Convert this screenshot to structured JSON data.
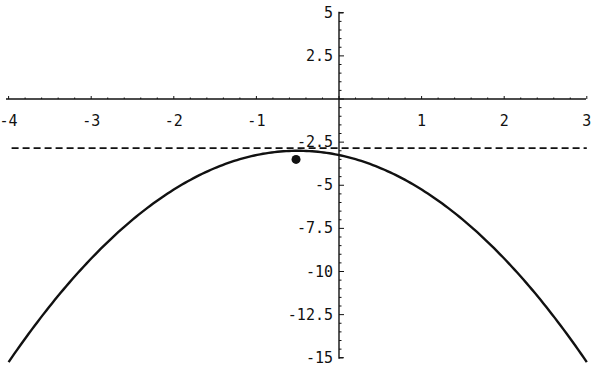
{
  "chart_data": {
    "type": "line",
    "title": "",
    "xlabel": "",
    "ylabel": "",
    "xlim": [
      -4,
      3
    ],
    "ylim": [
      -15,
      5
    ],
    "grid": false,
    "x_ticks": [
      -4,
      -3,
      -2,
      -1,
      1,
      2,
      3
    ],
    "x_tick_labels": [
      "-4",
      "-3",
      "-2",
      "-1",
      "1",
      "2",
      "3"
    ],
    "y_ticks": [
      5,
      2.5,
      -2.5,
      -5,
      -7.5,
      -10,
      -12.5,
      -15
    ],
    "y_tick_labels": [
      "5",
      "2.5",
      "-2.5",
      "-5",
      "-7.5",
      "-10",
      "-12.5",
      "-15"
    ],
    "series": [
      {
        "name": "parabola",
        "style": "solid",
        "formula": "y = -(x + 0.5)^2 - 3",
        "x": [
          -4,
          -3.5,
          -3,
          -2.5,
          -2,
          -1.5,
          -1,
          -0.5,
          0,
          0.5,
          1,
          1.5,
          2,
          2.5,
          3
        ],
        "values": [
          -15.25,
          -12,
          -9.25,
          -7,
          -5.25,
          -4,
          -3.25,
          -3,
          -3.25,
          -4,
          -5.25,
          -7,
          -9.25,
          -12,
          -15.25
        ]
      },
      {
        "name": "horizontal-reference",
        "style": "dashed",
        "x": [
          -4,
          3
        ],
        "values": [
          -2.85,
          -2.85
        ]
      }
    ],
    "points": [
      {
        "name": "marked-point",
        "x": -0.52,
        "y": -3.5
      }
    ],
    "colors": {
      "curve": "#111111",
      "axes": "#111111",
      "background": "#ffffff"
    }
  }
}
